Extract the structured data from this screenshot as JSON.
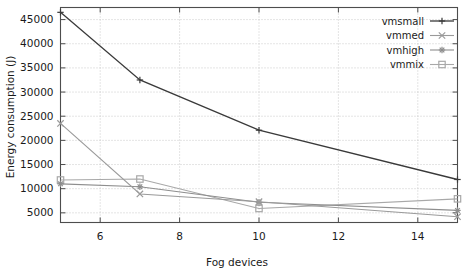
{
  "chart_data": {
    "type": "line",
    "title": "",
    "xlabel": "Fog devices",
    "ylabel": "Energy consumption (J)",
    "x": [
      5,
      7,
      10,
      15
    ],
    "xlim": [
      5,
      15
    ],
    "ylim": [
      3000,
      47500
    ],
    "xticks": [
      6,
      8,
      10,
      12,
      14
    ],
    "yticks": [
      5000,
      10000,
      15000,
      20000,
      25000,
      30000,
      35000,
      40000,
      45000
    ],
    "grid": true,
    "legend_position": "top-right",
    "series": [
      {
        "name": "vmsmall",
        "marker": "plus",
        "color": "#3a3a3a",
        "values": [
          46500,
          32500,
          22100,
          11900
        ]
      },
      {
        "name": "vmmed",
        "marker": "cross",
        "color": "#9a9a9a",
        "values": [
          23500,
          8900,
          7300,
          4200
        ]
      },
      {
        "name": "vmhigh",
        "marker": "star",
        "color": "#8e8e8e",
        "values": [
          11000,
          10400,
          7200,
          5500
        ]
      },
      {
        "name": "vmmix",
        "marker": "square",
        "color": "#a8a8a8",
        "values": [
          11800,
          12000,
          5900,
          7900
        ]
      }
    ]
  },
  "axes": {
    "ytick_labels": [
      "5000",
      "10000",
      "15000",
      "20000",
      "25000",
      "30000",
      "35000",
      "40000",
      "45000"
    ],
    "xtick_labels": [
      "6",
      "8",
      "10",
      "12",
      "14"
    ],
    "xlabel": "Fog devices",
    "ylabel": "Energy consumption (J)"
  },
  "legend": {
    "entries": [
      {
        "label": "vmsmall",
        "marker": "plus-marker"
      },
      {
        "label": "vmmed",
        "marker": "cross-marker"
      },
      {
        "label": "vmhigh",
        "marker": "star-marker"
      },
      {
        "label": "vmmix",
        "marker": "square-marker"
      }
    ]
  },
  "colors": {
    "axis": "#4d4d4d",
    "grid": "#bdbdbd",
    "background": "#ffffff",
    "text": "#1a1a1a"
  }
}
